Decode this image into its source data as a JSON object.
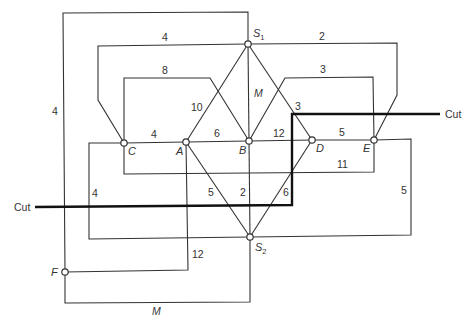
{
  "nodes": [
    {
      "id": "S1",
      "label": "S",
      "sub": "1",
      "x": 248,
      "y": 44
    },
    {
      "id": "S2",
      "label": "S",
      "sub": "2",
      "x": 250,
      "y": 237
    },
    {
      "id": "A",
      "label": "A",
      "x": 186,
      "y": 142
    },
    {
      "id": "B",
      "label": "B",
      "x": 249,
      "y": 141
    },
    {
      "id": "C",
      "label": "C",
      "x": 124,
      "y": 143
    },
    {
      "id": "D",
      "label": "D",
      "x": 312,
      "y": 140
    },
    {
      "id": "E",
      "label": "E",
      "x": 374,
      "y": 140
    },
    {
      "id": "F",
      "label": "F",
      "x": 65,
      "y": 272
    }
  ],
  "edges": [
    {
      "from": "F",
      "to": "S1",
      "weight": "4"
    },
    {
      "from": "S1",
      "to": "C",
      "weight": "4"
    },
    {
      "from": "C",
      "to": "B",
      "weight": "8"
    },
    {
      "from": "S1",
      "to": "A",
      "weight": "10"
    },
    {
      "from": "S1",
      "to": "B",
      "weight": "M"
    },
    {
      "from": "S1",
      "to": "D",
      "weight": "3"
    },
    {
      "from": "B",
      "to": "E",
      "weight": "3"
    },
    {
      "from": "S1",
      "to": "E",
      "weight": "2"
    },
    {
      "from": "C",
      "to": "A",
      "weight": "4"
    },
    {
      "from": "A",
      "to": "B",
      "weight": "6"
    },
    {
      "from": "B",
      "to": "D",
      "weight": "12"
    },
    {
      "from": "D",
      "to": "E",
      "weight": "5"
    },
    {
      "from": "C",
      "to": "E",
      "weight": "11"
    },
    {
      "from": "C",
      "to": "S2",
      "weight": "4"
    },
    {
      "from": "A",
      "to": "S2",
      "weight": "5"
    },
    {
      "from": "B",
      "to": "S2",
      "weight": "2"
    },
    {
      "from": "D",
      "to": "S2",
      "weight": "6"
    },
    {
      "from": "E",
      "to": "S2",
      "weight": "5"
    },
    {
      "from": "A",
      "to": "F",
      "weight": "12"
    },
    {
      "from": "F",
      "to": "S2",
      "weight": "M"
    }
  ],
  "cut": {
    "left_label": "Cut",
    "right_label": "Cut"
  }
}
